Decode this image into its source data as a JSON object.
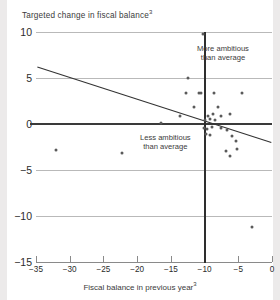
{
  "chart_data": {
    "type": "scatter",
    "title": "Targeted change in fiscal balance",
    "title_superscript": "3",
    "xlabel": "Fiscal balance in previous year",
    "xlabel_superscript": "3",
    "ylabel": "",
    "xlim": [
      -35,
      0
    ],
    "ylim": [
      -15,
      10
    ],
    "xticks": [
      -35,
      -30,
      -25,
      -20,
      -15,
      -10,
      -5,
      0
    ],
    "xtick_labels": [
      "−35",
      "−30",
      "−25",
      "−20",
      "−15",
      "−10",
      "−5",
      "0"
    ],
    "yticks": [
      10,
      5,
      0,
      -5,
      -10,
      -15
    ],
    "ytick_labels": [
      "10",
      "5",
      "0",
      "−5",
      "−10",
      "−15"
    ],
    "grid": "horizontal",
    "legend": "none",
    "annotations": [
      {
        "id": "more-ambitious",
        "text_line1": "More ambitious",
        "text_line2": "than average",
        "x": -9.0,
        "y": 7.2
      },
      {
        "id": "less-ambitious",
        "text_line1": "Less ambitious",
        "text_line2": "than average",
        "x": -18.5,
        "y": -1.9
      }
    ],
    "reference_lines": [
      {
        "id": "zero-horizontal",
        "orientation": "horizontal",
        "value": 0,
        "color": "#3a3a3a"
      },
      {
        "id": "average-vertical",
        "orientation": "vertical",
        "value": -10.0,
        "color": "#2e2e2e"
      }
    ],
    "trend_line": {
      "id": "regression-line",
      "x_start": -34.8,
      "y_start": 6.2,
      "x_end": -0.1,
      "y_end": -2.0,
      "color": "#333333"
    },
    "points": [
      {
        "x": -10.3,
        "y": 9.8
      },
      {
        "x": -12.5,
        "y": 5.0
      },
      {
        "x": -12.8,
        "y": 3.4
      },
      {
        "x": -10.9,
        "y": 3.4
      },
      {
        "x": -10.5,
        "y": 3.4
      },
      {
        "x": -8.6,
        "y": 3.4
      },
      {
        "x": -4.5,
        "y": 3.4
      },
      {
        "x": -11.6,
        "y": 1.9
      },
      {
        "x": -8.0,
        "y": 1.8
      },
      {
        "x": -13.7,
        "y": 0.9
      },
      {
        "x": -9.5,
        "y": 0.9
      },
      {
        "x": -8.7,
        "y": 1.1
      },
      {
        "x": -7.5,
        "y": 0.9
      },
      {
        "x": -6.2,
        "y": 1.1
      },
      {
        "x": -9.9,
        "y": 0.4
      },
      {
        "x": -9.2,
        "y": 0.5
      },
      {
        "x": -8.4,
        "y": 0.4
      },
      {
        "x": -16.4,
        "y": 0.1
      },
      {
        "x": -10.1,
        "y": -0.4
      },
      {
        "x": -9.6,
        "y": -0.5
      },
      {
        "x": -8.9,
        "y": -0.3
      },
      {
        "x": -7.6,
        "y": -0.4
      },
      {
        "x": -6.6,
        "y": -0.6
      },
      {
        "x": -9.8,
        "y": -1.1
      },
      {
        "x": -9.2,
        "y": -1.2
      },
      {
        "x": -6.0,
        "y": -1.3
      },
      {
        "x": -5.4,
        "y": -1.9
      },
      {
        "x": -32.1,
        "y": -2.8
      },
      {
        "x": -22.2,
        "y": -3.2
      },
      {
        "x": -6.8,
        "y": -2.9
      },
      {
        "x": -5.2,
        "y": -2.7
      },
      {
        "x": -6.2,
        "y": -3.5
      },
      {
        "x": -3.0,
        "y": -11.2
      }
    ]
  }
}
